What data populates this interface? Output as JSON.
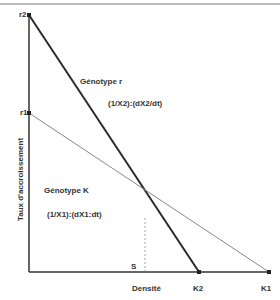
{
  "diagram": {
    "y_axis_label": "Taux d'accroissement",
    "x_axis_label": "Densité",
    "y_points": [
      {
        "label": "r2",
        "y_px": 15
      },
      {
        "label": "r1",
        "y_px": 113
      }
    ],
    "x_points": [
      {
        "label": "S",
        "x_px": 145
      },
      {
        "label": "K2",
        "x_px": 199
      },
      {
        "label": "K1",
        "x_px": 269
      }
    ],
    "lines": [
      {
        "name": "Génotype r",
        "equation": "(1/X2):(dX2/dt)",
        "from": "r2",
        "to": "K2",
        "stroke": "#2a2a2a",
        "width": 2
      },
      {
        "name": "Génotype K",
        "equation": "(1/X1):(dX1:dt)",
        "from": "r1",
        "to": "K1",
        "stroke": "#888888",
        "width": 1
      }
    ],
    "genotype_r_label": "Génotype r",
    "genotype_r_equation": "(1/X2):(dX2/dt)",
    "genotype_k_label": "Génotype K",
    "genotype_k_equation": "(1/X1):(dX1:dt)",
    "label_r2": "r2",
    "label_r1": "r1",
    "label_s": "S",
    "label_k2": "K2",
    "label_k1": "K1"
  }
}
